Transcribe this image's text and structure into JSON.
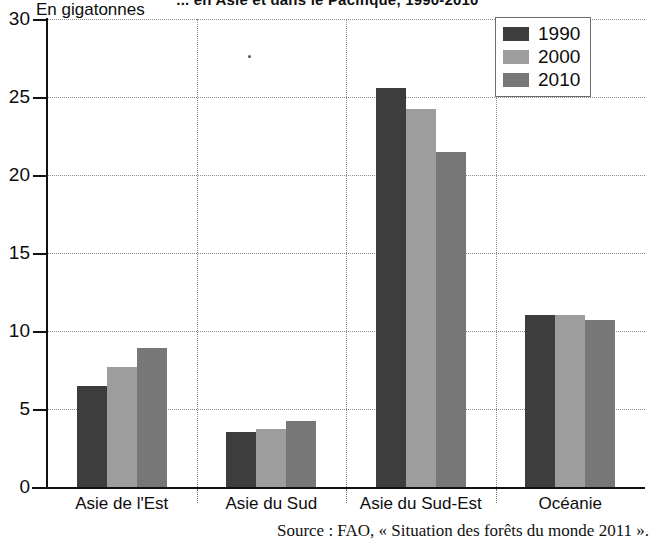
{
  "title": "... en Asie et dans le Pacifique, 1990-2010",
  "y_unit_label": "En gigatonnes",
  "source": "Source : FAO, « Situation des forêts du monde 2011 ».",
  "legend": {
    "items": [
      {
        "label": "1990",
        "color": "#3d3d3d"
      },
      {
        "label": "2000",
        "color": "#9d9d9d"
      },
      {
        "label": "2010",
        "color": "#777777"
      }
    ]
  },
  "axis": {
    "y_ticks": [
      "0",
      "5",
      "10",
      "15",
      "20",
      "25",
      "30"
    ]
  },
  "categories": [
    "Asie de l'Est",
    "Asie du Sud",
    "Asie du Sud-Est",
    "Océanie"
  ],
  "chart_data": {
    "type": "bar",
    "title": "... en Asie et dans le Pacifique, 1990-2010",
    "xlabel": "",
    "ylabel": "En gigatonnes",
    "ylim": [
      0,
      30
    ],
    "yticks": [
      0,
      5,
      10,
      15,
      20,
      25,
      30
    ],
    "grid": true,
    "legend_position": "top-right",
    "categories": [
      "Asie de l'Est",
      "Asie du Sud",
      "Asie du Sud-Est",
      "Océanie"
    ],
    "series": [
      {
        "name": "1990",
        "color": "#3d3d3d",
        "values": [
          6.5,
          3.5,
          25.6,
          11.0
        ]
      },
      {
        "name": "2000",
        "color": "#9d9d9d",
        "values": [
          7.7,
          3.7,
          24.2,
          11.0
        ]
      },
      {
        "name": "2010",
        "color": "#777777",
        "values": [
          8.9,
          4.2,
          21.5,
          10.7
        ]
      }
    ],
    "source": "Source : FAO, « Situation des forêts du monde 2011 »."
  }
}
